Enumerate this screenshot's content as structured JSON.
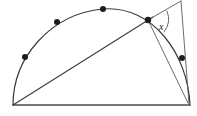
{
  "figure": {
    "background_color": "#ffffff",
    "stroke_color": "#3a3a3a",
    "dot_color": "#1d1d1d",
    "width": 197,
    "height": 116,
    "labels": {
      "angle": "x"
    },
    "baseline": {
      "name": "diameter",
      "x1": 13,
      "y1": 105,
      "x2": 190,
      "y2": 105
    },
    "arc": {
      "name": "semicircular-arc",
      "path": "M 13 105 A 89 96 0 0 1 190 105"
    },
    "chord": {
      "name": "chord-left-vertex-to-arc-point",
      "x1": 13,
      "y1": 105,
      "x2": 152,
      "y2": 18
    },
    "ray_up": {
      "name": "ray-to-apex",
      "x1": 148,
      "y1": 20,
      "x2": 181,
      "y2": 1
    },
    "ray_down": {
      "name": "ray-apex-to-lower-arc-point",
      "x1": 181,
      "y1": 1,
      "x2": 189,
      "y2": 104
    },
    "ray_vertex_to_lower": {
      "name": "ray-vertex-to-lower-arc-point",
      "x1": 148,
      "y1": 20,
      "x2": 188,
      "y2": 103
    },
    "angle_arc": {
      "name": "angle-sector-arc",
      "path": "M 166 10 A 20 20 0 0 1 163 31"
    },
    "dots": [
      {
        "name": "arc-point-1",
        "cx": 25,
        "cy": 57
      },
      {
        "name": "arc-point-2",
        "cx": 57,
        "cy": 22
      },
      {
        "name": "arc-point-3",
        "cx": 103,
        "cy": 9
      },
      {
        "name": "arc-point-4",
        "cx": 148,
        "cy": 20
      },
      {
        "name": "arc-point-5",
        "cx": 182,
        "cy": 58
      }
    ],
    "angle_label_position": {
      "x": 161,
      "y": 28
    }
  }
}
